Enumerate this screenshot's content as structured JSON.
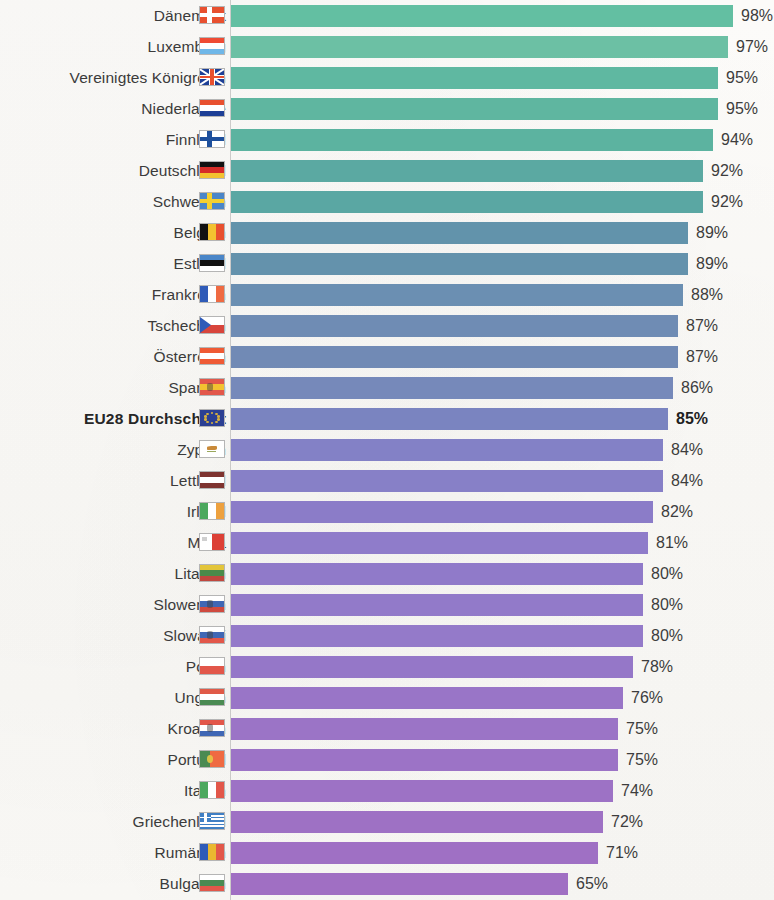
{
  "chart_data": {
    "type": "bar",
    "orientation": "horizontal",
    "title": "",
    "subtitle": "",
    "xlabel": "",
    "ylabel": "",
    "xlim": [
      0,
      100
    ],
    "grid": false,
    "legend": null,
    "value_suffix": "%",
    "highlight_category": "EU28 Durchschnitt",
    "categories": [
      "Dänemark",
      "Luxemburg",
      "Vereinigtes Königreich",
      "Niederlande",
      "Finnland",
      "Deutschland",
      "Schweden",
      "Belgien",
      "Estland",
      "Frankreich",
      "Tschechien",
      "Österreich",
      "Spanien",
      "EU28 Durchschnitt",
      "Zypern",
      "Lettland",
      "Irland",
      "Malta",
      "Litauen",
      "Slowenien",
      "Slowakei",
      "Polen",
      "Ungarn",
      "Kroatien",
      "Portugal",
      "Italien",
      "Griechenland",
      "Rumänien",
      "Bulgarien"
    ],
    "values": [
      98,
      97,
      95,
      95,
      94,
      92,
      92,
      89,
      89,
      88,
      87,
      87,
      86,
      85,
      84,
      84,
      82,
      81,
      80,
      80,
      80,
      78,
      76,
      75,
      75,
      74,
      72,
      71,
      65
    ],
    "value_labels": [
      "98%",
      "97%",
      "95%",
      "95%",
      "94%",
      "92%",
      "92%",
      "89%",
      "89%",
      "88%",
      "87%",
      "87%",
      "86%",
      "85%",
      "84%",
      "84%",
      "82%",
      "81%",
      "80%",
      "80%",
      "80%",
      "78%",
      "76%",
      "75%",
      "75%",
      "74%",
      "72%",
      "71%",
      "65%"
    ],
    "bar_colors": [
      "#63bfa2",
      "#6cc0a4",
      "#5fb8a1",
      "#5fb6a0",
      "#5cb3a0",
      "#5ba9a2",
      "#5aa7a3",
      "#6293ab",
      "#6492ac",
      "#6b8fb2",
      "#6f8cb4",
      "#718ab5",
      "#7689ba",
      "#7a84c0",
      "#8381c6",
      "#8780c7",
      "#8b7cc8",
      "#8f7cca",
      "#907ac9",
      "#927ac9",
      "#947ac9",
      "#9577c8",
      "#9975c7",
      "#9b74c6",
      "#9c73c6",
      "#9d72c5",
      "#9e71c4",
      "#9f70c4",
      "#a06fc3"
    ],
    "flags": [
      {
        "country": "Dänemark",
        "design": "nordic-cross",
        "colors": [
          "#e8502f",
          "#ffffff"
        ]
      },
      {
        "country": "Luxemburg",
        "design": "horizontal-3",
        "colors": [
          "#ef4b34",
          "#ffffff",
          "#6fb7e8"
        ]
      },
      {
        "country": "Vereinigtes Königreich",
        "design": "union-jack",
        "colors": [
          "#1d3f96",
          "#ffffff",
          "#e8502f"
        ]
      },
      {
        "country": "Niederlande",
        "design": "horizontal-3",
        "colors": [
          "#e8502f",
          "#ffffff",
          "#1d3f96"
        ]
      },
      {
        "country": "Finnland",
        "design": "nordic-cross",
        "colors": [
          "#ffffff",
          "#1d4f9c"
        ]
      },
      {
        "country": "Deutschland",
        "design": "horizontal-3",
        "colors": [
          "#111111",
          "#d62c28",
          "#f3c230"
        ]
      },
      {
        "country": "Schweden",
        "design": "nordic-cross",
        "colors": [
          "#4a86c8",
          "#f5d02f"
        ]
      },
      {
        "country": "Belgien",
        "design": "vertical-3",
        "colors": [
          "#121212",
          "#f3c230",
          "#e8502f"
        ]
      },
      {
        "country": "Estland",
        "design": "horizontal-3",
        "colors": [
          "#4a86c8",
          "#111111",
          "#ffffff"
        ]
      },
      {
        "country": "Frankreich",
        "design": "vertical-3",
        "colors": [
          "#2f5bb8",
          "#ffffff",
          "#ef6a42"
        ]
      },
      {
        "country": "Tschechien",
        "design": "wedge",
        "colors": [
          "#ffffff",
          "#d8453c",
          "#2f5bb8"
        ]
      },
      {
        "country": "Österreich",
        "design": "horizontal-3",
        "colors": [
          "#ef5a35",
          "#ffffff",
          "#ef5a35"
        ]
      },
      {
        "country": "Spanien",
        "design": "horizontal-3-crest",
        "colors": [
          "#e2574a",
          "#f3c230",
          "#e2574a"
        ]
      },
      {
        "country": "EU28 Durchschnitt",
        "design": "eu-stars",
        "colors": [
          "#2b3f93",
          "#f3c230"
        ]
      },
      {
        "country": "Zypern",
        "design": "plain-emblem",
        "colors": [
          "#ffffff",
          "#c98a3a"
        ]
      },
      {
        "country": "Lettland",
        "design": "horizontal-3",
        "colors": [
          "#7e3330",
          "#ffffff",
          "#7e3330"
        ]
      },
      {
        "country": "Irland",
        "design": "vertical-3",
        "colors": [
          "#4ca85e",
          "#ffffff",
          "#eda13f"
        ]
      },
      {
        "country": "Malta",
        "design": "vertical-2",
        "colors": [
          "#ffffff",
          "#dc4036"
        ]
      },
      {
        "country": "Litauen",
        "design": "horizontal-3",
        "colors": [
          "#e3c53a",
          "#4a8a4a",
          "#c0473e"
        ]
      },
      {
        "country": "Slowenien",
        "design": "horizontal-3-crest",
        "colors": [
          "#ffffff",
          "#3f67b5",
          "#cf4a3f"
        ]
      },
      {
        "country": "Slowakei",
        "design": "horizontal-3-crest",
        "colors": [
          "#ffffff",
          "#3f67b5",
          "#e2574a"
        ]
      },
      {
        "country": "Polen",
        "design": "horizontal-2",
        "colors": [
          "#ffffff",
          "#e2574a"
        ]
      },
      {
        "country": "Ungarn",
        "design": "horizontal-3",
        "colors": [
          "#e05a48",
          "#ffffff",
          "#4a8a52"
        ]
      },
      {
        "country": "Kroatien",
        "design": "horizontal-3-crest",
        "colors": [
          "#e2574a",
          "#ffffff",
          "#3f67b5"
        ]
      },
      {
        "country": "Portugal",
        "design": "vertical-2-crest",
        "colors": [
          "#4a8a52",
          "#ef6a42"
        ]
      },
      {
        "country": "Italien",
        "design": "vertical-3",
        "colors": [
          "#4ca85e",
          "#ffffff",
          "#e2574a"
        ]
      },
      {
        "country": "Griechenland",
        "design": "greek-stripes",
        "colors": [
          "#3f7fc4",
          "#ffffff"
        ]
      },
      {
        "country": "Rumänien",
        "design": "vertical-3",
        "colors": [
          "#2f5bb8",
          "#eab830",
          "#e2574a"
        ]
      },
      {
        "country": "Bulgarien",
        "design": "horizontal-3",
        "colors": [
          "#ffffff",
          "#4a8a52",
          "#e2574a"
        ]
      }
    ]
  }
}
